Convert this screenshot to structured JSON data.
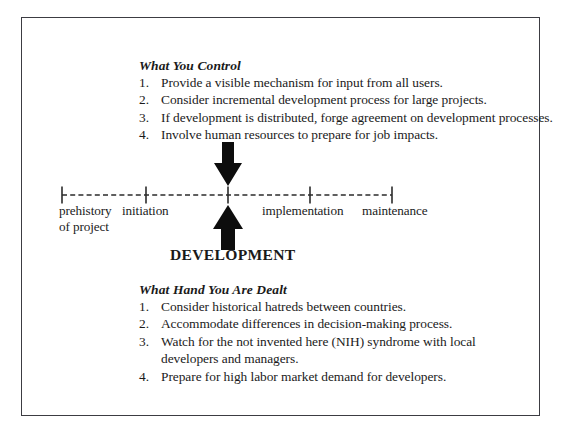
{
  "diagram": {
    "title_hidden": "Development timeline with influence factors",
    "center_label": "DEVELOPMENT",
    "colors": {
      "frame": "#3c3c42",
      "axis": "#2b2b2b",
      "arrow": "#0d0d0d",
      "text": "#1a1a1a"
    }
  },
  "top_block": {
    "heading": "What You Control",
    "items": [
      {
        "num": "1.",
        "text": "Provide a visible mechanism for input from all users."
      },
      {
        "num": "2.",
        "text": "Consider incremental development process for large projects."
      },
      {
        "num": "3.",
        "text": "If development is distributed, forge agreement on development processes."
      },
      {
        "num": "4.",
        "text": "Involve human resources to prepare for job impacts."
      }
    ]
  },
  "bottom_block": {
    "heading": "What Hand You Are Dealt",
    "items": [
      {
        "num": "1.",
        "text": "Consider historical hatreds between countries."
      },
      {
        "num": "2.",
        "text": "Accommodate differences in decision-making process."
      },
      {
        "num": "3.",
        "text": "Watch for the not invented here (NIH) syndrome with local developers and managers."
      },
      {
        "num": "4.",
        "text": "Prepare for high labor market demand for developers."
      }
    ]
  },
  "timeline": {
    "axis_style": "dashed",
    "ticks": [
      {
        "label_line1": "prehistory",
        "label_line2": "of project"
      },
      {
        "label_line1": "initiation",
        "label_line2": ""
      },
      {
        "label_line1": "",
        "label_line2": ""
      },
      {
        "label_line1": "implementation",
        "label_line2": ""
      },
      {
        "label_line1": "maintenance",
        "label_line2": ""
      }
    ]
  }
}
